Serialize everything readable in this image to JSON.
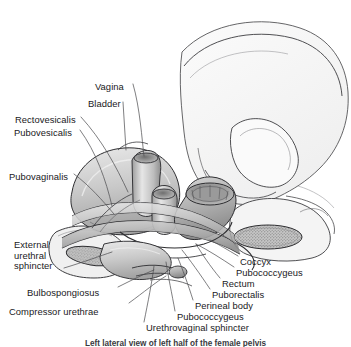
{
  "figure": {
    "caption": "Left lateral view of left half of the female pelvis",
    "background_color": "#ffffff",
    "line_color": "#2b2b2e",
    "text_color": "#19191c"
  },
  "labels_left": [
    {
      "id": "vagina",
      "text": "Vagina",
      "x": 95,
      "y": 82
    },
    {
      "id": "bladder",
      "text": "Bladder",
      "x": 88,
      "y": 99
    },
    {
      "id": "rectovesicalis",
      "text": "Rectovesicalis",
      "x": 15,
      "y": 115
    },
    {
      "id": "pubovesicalis",
      "text": "Pubovesicalis",
      "x": 14,
      "y": 128
    },
    {
      "id": "pubovaginalis",
      "text": "Pubovaginalis",
      "x": 9,
      "y": 172
    },
    {
      "id": "bulbospongiosus",
      "text": "Bulbospongiosus",
      "x": 27,
      "y": 288
    },
    {
      "id": "compressor-urethrae",
      "text": "Compressor urethrae",
      "x": 9,
      "y": 307
    }
  ],
  "label_external_urethral_sphincter": {
    "id": "external-urethral-sphincter",
    "line1": "External",
    "line2": "urethral",
    "line3": "sphincter",
    "x": 14,
    "y": 240
  },
  "labels_right": [
    {
      "id": "coccyx",
      "text": "Coccyx",
      "x": 240,
      "y": 257
    },
    {
      "id": "pubococcygeus-upper",
      "text": "Pubococcygeus",
      "x": 236,
      "y": 268
    },
    {
      "id": "rectum",
      "text": "Rectum",
      "x": 222,
      "y": 279
    },
    {
      "id": "puborectalis",
      "text": "Puborectalis",
      "x": 212,
      "y": 290
    },
    {
      "id": "perineal-body",
      "text": "Perineal body",
      "x": 195,
      "y": 301
    },
    {
      "id": "pubococcygeus-lower",
      "text": "Pubococcygeus",
      "x": 177,
      "y": 312
    },
    {
      "id": "urethrovaginal-sphincter",
      "text": "Urethrovaginal sphincter",
      "x": 146,
      "y": 323
    }
  ]
}
